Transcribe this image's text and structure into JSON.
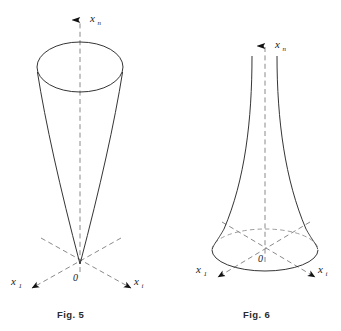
{
  "plate": {
    "width": 341,
    "height": 331,
    "background": "#ffffff",
    "ink_color": "#1d1d1d",
    "dash_color": "#8a8a8a"
  },
  "figures": [
    {
      "id": "fig5",
      "caption": "Fig. 5",
      "shape": "cone",
      "description": "Cone with apex at origin opening upward",
      "axes": {
        "vertical": {
          "label_base": "x",
          "label_sub": "n"
        },
        "left": {
          "label_base": "x",
          "label_sub": "1"
        },
        "right": {
          "label_base": "x",
          "label_sub": "i"
        },
        "origin": "0"
      },
      "geometry": {
        "apex": [
          80,
          264
        ],
        "top_ellipse_center": [
          80,
          67
        ],
        "top_ellipse_rx": 43,
        "top_ellipse_ry": 25,
        "axis_arrow_tip": [
          80,
          14
        ]
      }
    },
    {
      "id": "fig6",
      "caption": "Fig. 6",
      "shape": "hyperboloid-one-sheet",
      "description": "Hyperboloid of one sheet, narrow neck above, flaring to base ellipse",
      "axes": {
        "vertical": {
          "label_base": "x",
          "label_sub": "n"
        },
        "left": {
          "label_base": "x",
          "label_sub": "1"
        },
        "right": {
          "label_base": "x",
          "label_sub": "i"
        },
        "origin": "0"
      },
      "geometry": {
        "base_ellipse_center": [
          265,
          250
        ],
        "base_ellipse_rx": 53,
        "base_ellipse_ry": 21,
        "neck_top_y": 56,
        "neck_half_width_top": 12,
        "axis_arrow_tip": [
          265,
          40
        ]
      }
    }
  ]
}
